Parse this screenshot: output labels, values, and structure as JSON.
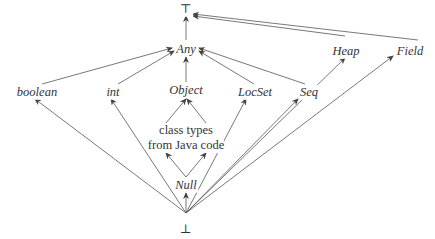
{
  "diagram": {
    "nodes": {
      "top": "⊤",
      "any": "Any",
      "heap": "Heap",
      "field": "Field",
      "boolean": "boolean",
      "int": "int",
      "object": "Object",
      "locset": "LocSet",
      "seq": "Seq",
      "class_types_line1": "class types",
      "class_types_line2": "from Java code",
      "null": "Null",
      "bottom": "⊥"
    },
    "edges": [
      {
        "from": "Any",
        "to": "⊤"
      },
      {
        "from": "Heap",
        "to": "⊤"
      },
      {
        "from": "Field",
        "to": "⊤"
      },
      {
        "from": "boolean",
        "to": "Any"
      },
      {
        "from": "int",
        "to": "Any"
      },
      {
        "from": "Object",
        "to": "Any"
      },
      {
        "from": "LocSet",
        "to": "Any"
      },
      {
        "from": "Seq",
        "to": "Any"
      },
      {
        "from": "class types from Java code",
        "to": "Object"
      },
      {
        "from": "Null",
        "to": "class types from Java code"
      },
      {
        "from": "⊥",
        "to": "Null"
      },
      {
        "from": "⊥",
        "to": "boolean"
      },
      {
        "from": "⊥",
        "to": "int"
      },
      {
        "from": "⊥",
        "to": "LocSet"
      },
      {
        "from": "⊥",
        "to": "Seq"
      },
      {
        "from": "⊥",
        "to": "Heap"
      },
      {
        "from": "⊥",
        "to": "Field"
      }
    ],
    "colors": {
      "line": "#444444",
      "text": "#333333",
      "background": "#ffffff"
    }
  }
}
